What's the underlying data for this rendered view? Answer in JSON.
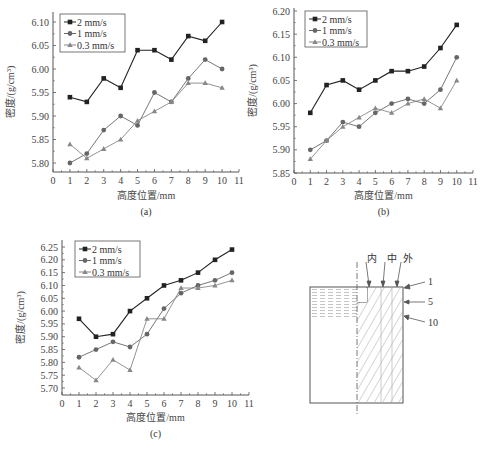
{
  "chart_data": [
    {
      "id": "a",
      "type": "line",
      "caption": "(a)",
      "xlabel": "高度位置/mm",
      "ylabel": "密度/(g/cm³)",
      "xlim": [
        0,
        11
      ],
      "ylim": [
        5.8,
        6.1
      ],
      "xticks": [
        "0",
        "1",
        "2",
        "3",
        "4",
        "5",
        "6",
        "7",
        "8",
        "9",
        "10",
        "11"
      ],
      "yticks": [
        "5.80",
        "5.85",
        "5.90",
        "5.95",
        "6.00",
        "6.05",
        "6.10"
      ],
      "legend_position": "upper-left",
      "grid": false,
      "x": [
        1,
        2,
        3,
        4,
        5,
        6,
        7,
        8,
        9,
        10
      ],
      "series": [
        {
          "name": "2 mm/s",
          "marker": "square",
          "color": "#222222",
          "values": [
            5.94,
            5.93,
            5.98,
            5.96,
            6.04,
            6.04,
            6.02,
            6.07,
            6.06,
            6.1
          ]
        },
        {
          "name": "1 mm/s",
          "marker": "circle",
          "color": "#666666",
          "values": [
            5.8,
            5.82,
            5.87,
            5.9,
            5.88,
            5.95,
            5.93,
            5.98,
            6.02,
            6.0
          ]
        },
        {
          "name": "0.3 mm/s",
          "marker": "triangle",
          "color": "#888888",
          "values": [
            5.84,
            5.81,
            5.83,
            5.85,
            5.89,
            5.91,
            5.93,
            5.97,
            5.97,
            5.96
          ]
        }
      ]
    },
    {
      "id": "b",
      "type": "line",
      "caption": "(b)",
      "xlabel": "高度位置/mm",
      "ylabel": "密度/(g/cm³)",
      "xlim": [
        0,
        11
      ],
      "ylim": [
        5.85,
        6.2
      ],
      "xticks": [
        "0",
        "1",
        "2",
        "3",
        "4",
        "5",
        "6",
        "7",
        "8",
        "9",
        "10",
        "11"
      ],
      "yticks": [
        "5.85",
        "5.90",
        "5.95",
        "6.00",
        "6.05",
        "6.10",
        "6.15",
        "6.20"
      ],
      "legend_position": "upper-left",
      "grid": false,
      "x": [
        1,
        2,
        3,
        4,
        5,
        6,
        7,
        8,
        9,
        10
      ],
      "series": [
        {
          "name": "2 mm/s",
          "marker": "square",
          "color": "#222222",
          "values": [
            5.98,
            6.04,
            6.05,
            6.03,
            6.05,
            6.07,
            6.07,
            6.08,
            6.12,
            6.17
          ]
        },
        {
          "name": "1 mm/s",
          "marker": "circle",
          "color": "#666666",
          "values": [
            5.9,
            5.92,
            5.96,
            5.95,
            5.98,
            6.0,
            6.01,
            6.0,
            6.03,
            6.1
          ]
        },
        {
          "name": "0.3 mm/s",
          "marker": "triangle",
          "color": "#888888",
          "values": [
            5.88,
            5.92,
            5.95,
            5.97,
            5.99,
            5.98,
            6.0,
            6.01,
            5.99,
            6.05
          ]
        }
      ]
    },
    {
      "id": "c",
      "type": "line",
      "caption": "(c)",
      "xlabel": "高度位置/mm",
      "ylabel": "密度/(g/cm³)",
      "xlim": [
        0,
        11
      ],
      "ylim": [
        5.7,
        6.25
      ],
      "xticks": [
        "0",
        "1",
        "2",
        "3",
        "4",
        "5",
        "6",
        "7",
        "8",
        "9",
        "10",
        "11"
      ],
      "yticks": [
        "5.70",
        "5.75",
        "5.80",
        "5.85",
        "5.90",
        "5.95",
        "6.00",
        "6.05",
        "6.10",
        "6.15",
        "6.20",
        "6.25"
      ],
      "legend_position": "upper-left",
      "grid": false,
      "x": [
        1,
        2,
        3,
        4,
        5,
        6,
        7,
        8,
        9,
        10
      ],
      "series": [
        {
          "name": "2 mm/s",
          "marker": "square",
          "color": "#222222",
          "values": [
            5.97,
            5.9,
            5.91,
            6.0,
            6.05,
            6.1,
            6.12,
            6.15,
            6.2,
            6.24
          ]
        },
        {
          "name": "1 mm/s",
          "marker": "circle",
          "color": "#666666",
          "values": [
            5.82,
            5.85,
            5.88,
            5.86,
            5.91,
            6.01,
            6.07,
            6.1,
            6.12,
            6.15
          ]
        },
        {
          "name": "0.3 mm/s",
          "marker": "triangle",
          "color": "#888888",
          "values": [
            5.78,
            5.73,
            5.81,
            5.77,
            5.97,
            5.97,
            6.09,
            6.09,
            6.1,
            6.12
          ]
        }
      ]
    }
  ],
  "diagram": {
    "top_labels": [
      "内",
      "中",
      "外"
    ],
    "side_labels": [
      "1",
      "5",
      "10"
    ]
  }
}
